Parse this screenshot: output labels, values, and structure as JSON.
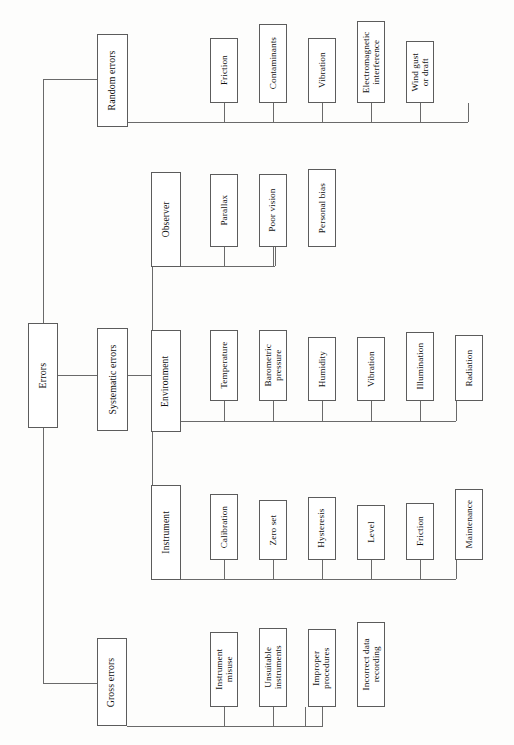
{
  "diagram": {
    "title": "Errors",
    "orientation": "rotated-90-ccw",
    "root": {
      "label": "Errors"
    },
    "branches": [
      {
        "label": "Random errors",
        "children": [
          {
            "label": "Friction"
          },
          {
            "label": "Contaminants"
          },
          {
            "label": "Vibration"
          },
          {
            "label": "Electromagnetic\ninterference"
          },
          {
            "label": "Wind gust\nor draft"
          }
        ]
      },
      {
        "label": "Systematic errors",
        "children": [
          {
            "label": "Observer",
            "children": [
              {
                "label": "Parallax"
              },
              {
                "label": "Poor vision"
              },
              {
                "label": "Personal bias"
              }
            ]
          },
          {
            "label": "Environment",
            "children": [
              {
                "label": "Temperature"
              },
              {
                "label": "Barometric\npressure"
              },
              {
                "label": "Humidity"
              },
              {
                "label": "Vibration"
              },
              {
                "label": "Illumination"
              },
              {
                "label": "Radiation"
              }
            ]
          },
          {
            "label": "Instrument",
            "children": [
              {
                "label": "Calibration"
              },
              {
                "label": "Zero set"
              },
              {
                "label": "Hysteresis"
              },
              {
                "label": "Level"
              },
              {
                "label": "Friction"
              },
              {
                "label": "Maintenance"
              }
            ]
          }
        ]
      },
      {
        "label": "Gross errors",
        "children": [
          {
            "label": "Instrument\nmisuse"
          },
          {
            "label": "Unsuitable\ninstruments"
          },
          {
            "label": "Improper\nprocedures"
          },
          {
            "label": "Incorrect data\nrecording"
          }
        ]
      }
    ],
    "colors": {
      "page_background": "#fdfdfc",
      "box_border": "#5c5c5c",
      "box_fill": "#ffffff",
      "connector": "#6a6a6a",
      "text": "#111111"
    }
  }
}
